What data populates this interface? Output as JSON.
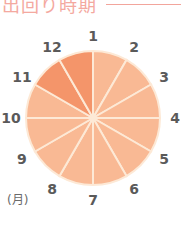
{
  "header": {
    "title": "出回り時期"
  },
  "wheel": {
    "unit_label": "(月)",
    "colors": {
      "in_season": "#f4956a",
      "off_season": "#f9b994",
      "divider": "#fde9d6"
    },
    "months": [
      {
        "label": "1",
        "in_season": false
      },
      {
        "label": "2",
        "in_season": false
      },
      {
        "label": "3",
        "in_season": false
      },
      {
        "label": "4",
        "in_season": false
      },
      {
        "label": "5",
        "in_season": false
      },
      {
        "label": "6",
        "in_season": false
      },
      {
        "label": "7",
        "in_season": false
      },
      {
        "label": "8",
        "in_season": false
      },
      {
        "label": "9",
        "in_season": false
      },
      {
        "label": "10",
        "in_season": false
      },
      {
        "label": "11",
        "in_season": true
      },
      {
        "label": "12",
        "in_season": true
      }
    ]
  },
  "chart_data": {
    "type": "pie",
    "title": "出回り時期",
    "unit": "月",
    "categories": [
      "1",
      "2",
      "3",
      "4",
      "5",
      "6",
      "7",
      "8",
      "9",
      "10",
      "11",
      "12"
    ],
    "values": [
      1,
      1,
      1,
      1,
      1,
      1,
      1,
      1,
      1,
      1,
      1,
      1
    ],
    "highlighted": [
      "11",
      "12"
    ]
  }
}
